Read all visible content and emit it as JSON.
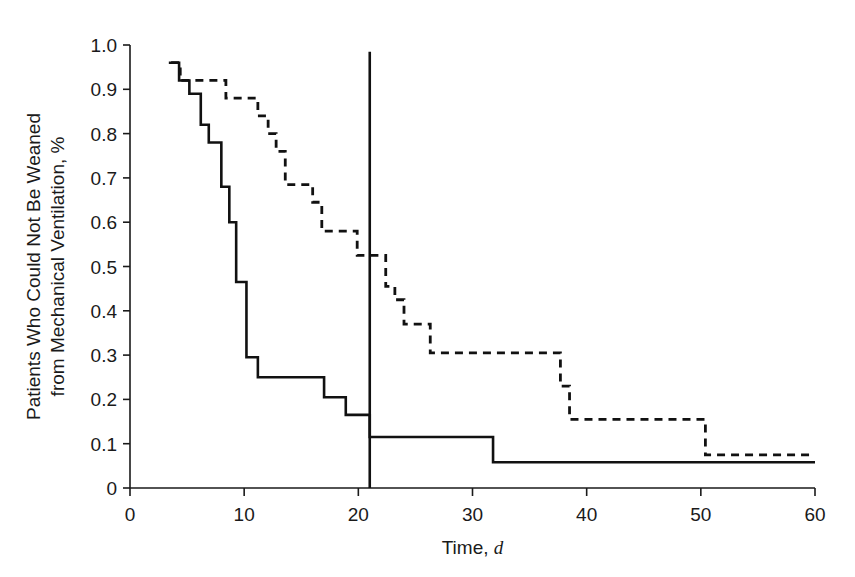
{
  "chart_data": {
    "type": "line",
    "title": "",
    "subtitle": "",
    "xlabel": "Time, d",
    "xlabel_main": "Time,",
    "xlabel_italic": "d",
    "ylabel": "Patients Who Could Not Be Weaned from Mechanical Ventilation, %",
    "ylabel_line1": "Patients Who Could Not Be Weaned",
    "ylabel_line2": "from Mechanical Ventilation, %",
    "xlim": [
      0,
      60
    ],
    "ylim": [
      0,
      1.0
    ],
    "xticks": [
      0,
      10,
      20,
      30,
      40,
      50,
      60
    ],
    "xtick_labels": [
      "0",
      "10",
      "20",
      "30",
      "40",
      "50",
      "60"
    ],
    "yticks": [
      0,
      0.1,
      0.2,
      0.3,
      0.4,
      0.5,
      0.6,
      0.7,
      0.8,
      0.9,
      1.0
    ],
    "ytick_labels": [
      "0",
      "0.1",
      "0.2",
      "0.3",
      "0.4",
      "0.5",
      "0.6",
      "0.7",
      "0.8",
      "0.9",
      "1.0"
    ],
    "grid": false,
    "legend": "none",
    "plot_style": "kaplan-meier step function",
    "annotations": [
      {
        "name": "vertical-reference-line",
        "x": 21,
        "y_from": 0,
        "y_to": 0.985,
        "style": "solid"
      }
    ],
    "series": [
      {
        "name": "solid-curve",
        "line_style": "solid",
        "color": "#111111",
        "step": "post",
        "points": [
          {
            "x": 3.4,
            "y": 0.96
          },
          {
            "x": 4.3,
            "y": 0.92
          },
          {
            "x": 5.2,
            "y": 0.89
          },
          {
            "x": 6.2,
            "y": 0.82
          },
          {
            "x": 6.9,
            "y": 0.78
          },
          {
            "x": 8.0,
            "y": 0.68
          },
          {
            "x": 8.7,
            "y": 0.6
          },
          {
            "x": 9.3,
            "y": 0.465
          },
          {
            "x": 10.2,
            "y": 0.295
          },
          {
            "x": 11.2,
            "y": 0.25
          },
          {
            "x": 17.0,
            "y": 0.205
          },
          {
            "x": 18.9,
            "y": 0.165
          },
          {
            "x": 20.6,
            "y": 0.165
          },
          {
            "x": 21.0,
            "y": 0.115
          },
          {
            "x": 31.8,
            "y": 0.058
          },
          {
            "x": 60.0,
            "y": 0.058
          }
        ]
      },
      {
        "name": "dashed-curve",
        "line_style": "dashed",
        "color": "#111111",
        "step": "post",
        "points": [
          {
            "x": 3.6,
            "y": 0.96
          },
          {
            "x": 4.4,
            "y": 0.92
          },
          {
            "x": 7.6,
            "y": 0.92
          },
          {
            "x": 8.4,
            "y": 0.88
          },
          {
            "x": 10.3,
            "y": 0.88
          },
          {
            "x": 11.2,
            "y": 0.84
          },
          {
            "x": 12.1,
            "y": 0.8
          },
          {
            "x": 12.8,
            "y": 0.76
          },
          {
            "x": 13.6,
            "y": 0.685
          },
          {
            "x": 15.2,
            "y": 0.685
          },
          {
            "x": 16.0,
            "y": 0.645
          },
          {
            "x": 16.8,
            "y": 0.58
          },
          {
            "x": 19.2,
            "y": 0.58
          },
          {
            "x": 19.9,
            "y": 0.525
          },
          {
            "x": 21.6,
            "y": 0.525
          },
          {
            "x": 22.4,
            "y": 0.455
          },
          {
            "x": 23.2,
            "y": 0.425
          },
          {
            "x": 24.0,
            "y": 0.37
          },
          {
            "x": 25.6,
            "y": 0.37
          },
          {
            "x": 26.3,
            "y": 0.305
          },
          {
            "x": 36.9,
            "y": 0.305
          },
          {
            "x": 37.7,
            "y": 0.23
          },
          {
            "x": 38.5,
            "y": 0.155
          },
          {
            "x": 49.7,
            "y": 0.155
          },
          {
            "x": 50.4,
            "y": 0.075
          },
          {
            "x": 60.0,
            "y": 0.075
          }
        ]
      }
    ]
  }
}
